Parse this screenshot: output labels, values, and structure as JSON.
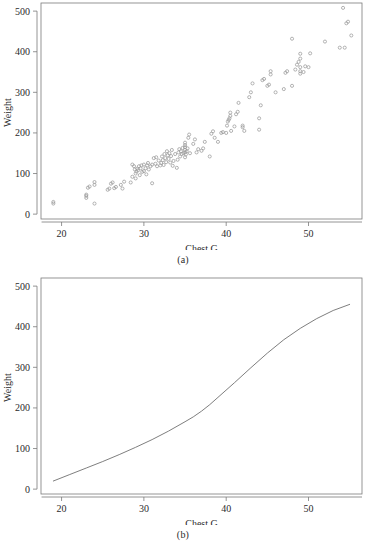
{
  "figure": {
    "panels": [
      {
        "id": "a",
        "caption": "(a)",
        "xlabel": "Chest.G",
        "ylabel": "Weight"
      },
      {
        "id": "b",
        "caption": "(b)",
        "xlabel": "Chest.G",
        "ylabel": "Weight"
      }
    ]
  },
  "axis": {
    "x_ticks": [
      "20",
      "30",
      "40",
      "50"
    ],
    "y_ticks": [
      "0",
      "100",
      "200",
      "300",
      "400",
      "500"
    ]
  },
  "colors": {
    "frame": "#7a7a7a",
    "point": "#9a9a9a",
    "curve": "#6f6f6f",
    "text": "#2b2b2b",
    "background": "#ffffff"
  },
  "chart_data": [
    {
      "type": "scatter",
      "panel": "a",
      "title": "",
      "xlabel": "Chest.G",
      "ylabel": "Weight",
      "xlim": [
        17.5,
        56.5
      ],
      "ylim": [
        -12,
        520
      ],
      "xticks": [
        20,
        30,
        40,
        50
      ],
      "yticks": [
        0,
        100,
        200,
        300,
        400,
        500
      ],
      "grid": false,
      "legend": null,
      "marker": "open-circle",
      "points": [
        [
          19.0,
          26
        ],
        [
          19.0,
          30
        ],
        [
          23.0,
          40
        ],
        [
          23.0,
          45
        ],
        [
          23.0,
          48
        ],
        [
          23.2,
          65
        ],
        [
          23.4,
          68
        ],
        [
          24.0,
          26
        ],
        [
          24.0,
          72
        ],
        [
          24.0,
          79
        ],
        [
          25.6,
          60
        ],
        [
          25.8,
          63
        ],
        [
          26.0,
          75
        ],
        [
          26.2,
          78
        ],
        [
          26.4,
          64
        ],
        [
          26.6,
          67
        ],
        [
          27.2,
          72
        ],
        [
          27.4,
          63
        ],
        [
          27.6,
          80
        ],
        [
          28.4,
          78
        ],
        [
          28.6,
          92
        ],
        [
          28.6,
          122
        ],
        [
          28.8,
          118
        ],
        [
          28.9,
          110
        ],
        [
          29.0,
          88
        ],
        [
          29.0,
          100
        ],
        [
          29.1,
          105
        ],
        [
          29.2,
          112
        ],
        [
          29.3,
          108
        ],
        [
          29.4,
          118
        ],
        [
          29.5,
          96
        ],
        [
          29.6,
          113
        ],
        [
          29.7,
          120
        ],
        [
          29.8,
          104
        ],
        [
          30.0,
          106
        ],
        [
          30.0,
          122
        ],
        [
          30.2,
          113
        ],
        [
          30.3,
          98
        ],
        [
          30.4,
          120
        ],
        [
          30.5,
          126
        ],
        [
          30.6,
          110
        ],
        [
          30.8,
          118
        ],
        [
          31.0,
          76
        ],
        [
          31.0,
          122
        ],
        [
          31.2,
          138
        ],
        [
          31.4,
          124
        ],
        [
          31.5,
          140
        ],
        [
          31.6,
          118
        ],
        [
          31.8,
          132
        ],
        [
          32.0,
          120
        ],
        [
          32.1,
          126
        ],
        [
          32.2,
          142
        ],
        [
          32.3,
          133
        ],
        [
          32.4,
          121
        ],
        [
          32.5,
          148
        ],
        [
          32.6,
          138
        ],
        [
          32.7,
          128
        ],
        [
          32.8,
          155
        ],
        [
          32.9,
          145
        ],
        [
          33.0,
          136
        ],
        [
          33.1,
          150
        ],
        [
          33.2,
          127
        ],
        [
          33.3,
          143
        ],
        [
          33.4,
          158
        ],
        [
          33.5,
          119
        ],
        [
          33.6,
          131
        ],
        [
          33.8,
          148
        ],
        [
          34.0,
          114
        ],
        [
          34.1,
          134
        ],
        [
          34.2,
          152
        ],
        [
          34.3,
          160
        ],
        [
          34.4,
          142
        ],
        [
          34.5,
          155
        ],
        [
          34.6,
          148
        ],
        [
          34.7,
          163
        ],
        [
          34.8,
          150
        ],
        [
          35.0,
          140
        ],
        [
          35.0,
          152
        ],
        [
          35.0,
          158
        ],
        [
          35.0,
          165
        ],
        [
          35.0,
          170
        ],
        [
          35.0,
          176
        ],
        [
          35.1,
          147
        ],
        [
          35.2,
          155
        ],
        [
          35.3,
          162
        ],
        [
          35.4,
          188
        ],
        [
          35.5,
          196
        ],
        [
          35.6,
          150
        ],
        [
          36.0,
          173
        ],
        [
          36.2,
          184
        ],
        [
          36.4,
          152
        ],
        [
          36.6,
          160
        ],
        [
          37.0,
          156
        ],
        [
          37.2,
          162
        ],
        [
          37.4,
          178
        ],
        [
          38.0,
          142
        ],
        [
          38.2,
          198
        ],
        [
          38.4,
          204
        ],
        [
          38.6,
          188
        ],
        [
          39.0,
          178
        ],
        [
          39.4,
          200
        ],
        [
          39.6,
          202
        ],
        [
          40.0,
          200
        ],
        [
          40.1,
          218
        ],
        [
          40.2,
          228
        ],
        [
          40.3,
          232
        ],
        [
          40.4,
          236
        ],
        [
          40.5,
          242
        ],
        [
          40.5,
          250
        ],
        [
          40.6,
          205
        ],
        [
          41.0,
          216
        ],
        [
          41.2,
          246
        ],
        [
          41.4,
          252
        ],
        [
          41.5,
          274
        ],
        [
          42.0,
          214
        ],
        [
          42.0,
          218
        ],
        [
          42.2,
          205
        ],
        [
          42.8,
          288
        ],
        [
          43.0,
          300
        ],
        [
          43.2,
          322
        ],
        [
          44.0,
          208
        ],
        [
          44.0,
          236
        ],
        [
          44.2,
          268
        ],
        [
          44.4,
          330
        ],
        [
          44.6,
          333
        ],
        [
          45.0,
          316
        ],
        [
          45.2,
          319
        ],
        [
          45.4,
          344
        ],
        [
          45.4,
          352
        ],
        [
          46.0,
          300
        ],
        [
          47.0,
          308
        ],
        [
          47.2,
          348
        ],
        [
          47.4,
          352
        ],
        [
          48.0,
          316
        ],
        [
          48.0,
          432
        ],
        [
          48.4,
          356
        ],
        [
          48.6,
          368
        ],
        [
          48.8,
          375
        ],
        [
          49.0,
          346
        ],
        [
          49.0,
          352
        ],
        [
          49.0,
          362
        ],
        [
          49.0,
          383
        ],
        [
          49.0,
          395
        ],
        [
          49.4,
          350
        ],
        [
          49.6,
          364
        ],
        [
          50.0,
          362
        ],
        [
          50.2,
          396
        ],
        [
          52.0,
          425
        ],
        [
          53.8,
          410
        ],
        [
          54.2,
          508
        ],
        [
          54.4,
          410
        ],
        [
          54.6,
          470
        ],
        [
          54.8,
          474
        ],
        [
          55.2,
          440
        ]
      ]
    },
    {
      "type": "line",
      "panel": "b",
      "title": "",
      "xlabel": "Chest.G",
      "ylabel": "Weight",
      "xlim": [
        17.5,
        56.5
      ],
      "ylim": [
        -12,
        520
      ],
      "xticks": [
        20,
        30,
        40,
        50
      ],
      "yticks": [
        0,
        100,
        200,
        300,
        400,
        500
      ],
      "grid": false,
      "legend": null,
      "series": [
        {
          "name": "smooth-fit",
          "x": [
            19.0,
            21.0,
            23.0,
            25.0,
            27.0,
            29.0,
            31.0,
            33.0,
            35.0,
            36.0,
            37.0,
            38.0,
            39.0,
            41.0,
            43.0,
            45.0,
            47.0,
            49.0,
            51.0,
            53.0,
            55.0
          ],
          "y": [
            20,
            36,
            52,
            68,
            85,
            103,
            122,
            143,
            166,
            178,
            192,
            208,
            226,
            262,
            299,
            335,
            368,
            396,
            420,
            440,
            455
          ]
        }
      ]
    }
  ]
}
